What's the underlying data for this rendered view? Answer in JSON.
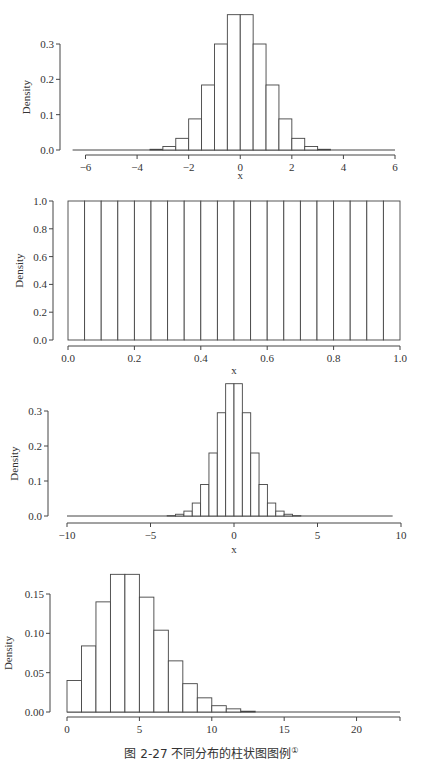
{
  "caption": {
    "text": "图 2-27   不同分布的柱状图图例",
    "footnote_mark": "①"
  },
  "chart_data": [
    {
      "type": "bar",
      "subtype": "histogram",
      "title": "",
      "xlabel": "x",
      "ylabel": "Density",
      "xlim": [
        -6,
        6
      ],
      "ylim": [
        0,
        0.3
      ],
      "grid": false,
      "xticks": [
        -6,
        -4,
        -2,
        0,
        2,
        4,
        6
      ],
      "xtick_labels": [
        "−6",
        "−4",
        "−2",
        "0",
        "2",
        "4",
        "6"
      ],
      "yticks": [
        0.0,
        0.1,
        0.2,
        0.3
      ],
      "ytick_labels": [
        "0.0",
        "0.1",
        "0.2",
        "0.3"
      ],
      "bin_width": 0.5,
      "baseline_range": [
        -6.5,
        6
      ],
      "bins": [
        -3.5,
        -3.0,
        -2.5,
        -2.0,
        -1.5,
        -1.0,
        -0.5,
        0.0,
        0.5,
        1.0,
        1.5,
        2.0,
        2.5,
        3.0
      ],
      "values": [
        0.002,
        0.01,
        0.033,
        0.088,
        0.184,
        0.3,
        0.383,
        0.383,
        0.3,
        0.184,
        0.088,
        0.033,
        0.01,
        0.002
      ]
    },
    {
      "type": "bar",
      "subtype": "histogram",
      "title": "",
      "xlabel": "x",
      "ylabel": "Density",
      "xlim": [
        0,
        1
      ],
      "ylim": [
        0,
        1
      ],
      "grid": false,
      "xticks": [
        0.0,
        0.2,
        0.4,
        0.6,
        0.8,
        1.0
      ],
      "xtick_labels": [
        "0.0",
        "0.2",
        "0.4",
        "0.6",
        "0.8",
        "1.0"
      ],
      "yticks": [
        0.0,
        0.2,
        0.4,
        0.6,
        0.8,
        1.0
      ],
      "ytick_labels": [
        "0.0",
        "0.2",
        "0.4",
        "0.6",
        "0.8",
        "1.0"
      ],
      "bin_width": 0.05,
      "bins": [
        0.0,
        0.05,
        0.1,
        0.15,
        0.2,
        0.25,
        0.3,
        0.35,
        0.4,
        0.45,
        0.5,
        0.55,
        0.6,
        0.65,
        0.7,
        0.75,
        0.8,
        0.85,
        0.9,
        0.95
      ],
      "values": [
        1.0,
        1.0,
        1.0,
        1.0,
        1.0,
        1.0,
        1.0,
        1.0,
        1.0,
        1.0,
        1.0,
        1.0,
        1.0,
        1.0,
        1.0,
        1.0,
        1.0,
        1.0,
        1.0,
        1.0
      ]
    },
    {
      "type": "bar",
      "subtype": "histogram",
      "title": "",
      "xlabel": "x",
      "ylabel": "Density",
      "xlim": [
        -10,
        10
      ],
      "ylim": [
        0,
        0.3
      ],
      "grid": false,
      "xticks": [
        -10,
        -5,
        0,
        5,
        10
      ],
      "xtick_labels": [
        "−10",
        "−5",
        "0",
        "5",
        "10"
      ],
      "yticks": [
        0.0,
        0.1,
        0.2,
        0.3
      ],
      "ytick_labels": [
        "0.0",
        "0.1",
        "0.2",
        "0.3"
      ],
      "bin_width": 0.5,
      "baseline_range": [
        -10,
        9.5
      ],
      "bins": [
        -4.0,
        -3.5,
        -3.0,
        -2.5,
        -2.0,
        -1.5,
        -1.0,
        -0.5,
        0.0,
        0.5,
        1.0,
        1.5,
        2.0,
        2.5,
        3.0,
        3.5
      ],
      "values": [
        0.001,
        0.005,
        0.014,
        0.037,
        0.09,
        0.18,
        0.295,
        0.378,
        0.378,
        0.295,
        0.18,
        0.09,
        0.037,
        0.014,
        0.005,
        0.001
      ]
    },
    {
      "type": "bar",
      "subtype": "histogram",
      "title": "",
      "xlabel": "",
      "ylabel": "Density",
      "xlim": [
        0,
        23
      ],
      "ylim": [
        0,
        0.15
      ],
      "grid": false,
      "xticks": [
        0,
        5,
        10,
        15,
        20
      ],
      "xtick_labels": [
        "0",
        "5",
        "10",
        "15",
        "20"
      ],
      "yticks": [
        0.0,
        0.05,
        0.1,
        0.15
      ],
      "ytick_labels": [
        "0.00",
        "0.05",
        "0.10",
        "0.15"
      ],
      "bin_width": 1,
      "baseline_range": [
        0,
        23
      ],
      "bins": [
        0,
        1,
        2,
        3,
        4,
        5,
        6,
        7,
        8,
        9,
        10,
        11,
        12
      ],
      "values": [
        0.04,
        0.084,
        0.14,
        0.175,
        0.175,
        0.146,
        0.104,
        0.065,
        0.036,
        0.018,
        0.008,
        0.004,
        0.001
      ]
    }
  ],
  "layout": [
    {
      "plot_x0": 85.5,
      "plot_x1": 395,
      "y0_px": 150,
      "ytop_px": 44,
      "yaxis_x": 60,
      "xaxis_y": 155,
      "xlabel_y": 179
    },
    {
      "plot_x0": 68,
      "plot_x1": 400,
      "y0_px": 340,
      "ytop_px": 201,
      "yaxis_x": 53,
      "xaxis_y": 346,
      "xlabel_y": 374
    },
    {
      "plot_x0": 67,
      "plot_x1": 401,
      "y0_px": 516,
      "ytop_px": 411,
      "yaxis_x": 48,
      "xaxis_y": 523,
      "xlabel_y": 553
    },
    {
      "plot_x0": 67,
      "plot_x1": 400,
      "y0_px": 712,
      "ytop_px": 594,
      "yaxis_x": 50,
      "xaxis_y": 717,
      "xlabel_y": 0
    }
  ]
}
